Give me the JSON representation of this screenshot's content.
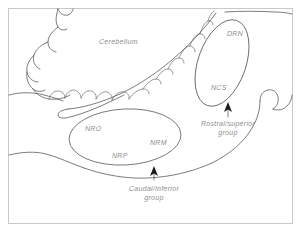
{
  "figure": {
    "kind": "anatomical-line-diagram",
    "width": 301,
    "height": 232,
    "background_color": "#ffffff",
    "border_color": "#c9c9cc",
    "line_color": "#5b5b5e",
    "label_color": "#8e8e92",
    "arrow_color": "#1b1b1b"
  },
  "labels": {
    "cerebellum": "Cerebellum",
    "drn": "DRN",
    "ncs": "NCS",
    "nro": "NRO",
    "nrm": "NRM",
    "nrp": "NRP",
    "rostral_group_line1": "Rostral/superior",
    "rostral_group_line2": "group",
    "caudal_group_line1": "Caudal/inferior",
    "caudal_group_line2": "group"
  },
  "annotations": {
    "rostral_arrow": "arrow-up-icon",
    "caudal_arrow": "arrow-up-icon"
  }
}
